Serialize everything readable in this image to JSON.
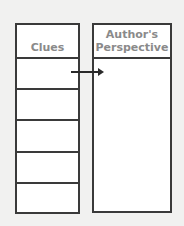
{
  "diagram": {
    "left_column": {
      "title": "Clues",
      "row_count": 5
    },
    "right_column": {
      "title": "Author's Perspective"
    },
    "connector": {
      "from": "clues-row-1",
      "to": "author-perspective-box",
      "icon": "arrow-right-icon"
    },
    "colors": {
      "border": "#3a3a3a",
      "header_text": "#8a8a8a",
      "background": "#f1f1f0",
      "cell": "#ffffff"
    }
  }
}
